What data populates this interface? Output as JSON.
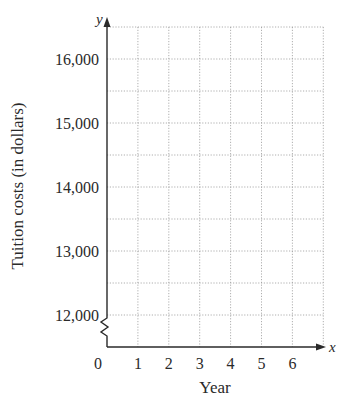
{
  "chart_data": {
    "type": "line",
    "title": "",
    "xlabel": "Year",
    "ylabel": "Tuition costs (in dollars)",
    "x_axis_var": "x",
    "y_axis_var": "y",
    "x_ticks": [
      "0",
      "1",
      "2",
      "3",
      "4",
      "5",
      "6"
    ],
    "y_ticks": [
      "12,000",
      "13,000",
      "14,000",
      "15,000",
      "16,000"
    ],
    "xlim": [
      0,
      7
    ],
    "ylim": [
      12000,
      16500
    ],
    "x_grid_step": 1,
    "y_grid_step": 500,
    "grid": true,
    "axis_break_on_y": true,
    "series": [],
    "legend": null
  },
  "labels": {
    "xlabel": "Year",
    "ylabel": "Tuition costs (in dollars)",
    "x_var": "x",
    "y_var": "y"
  }
}
